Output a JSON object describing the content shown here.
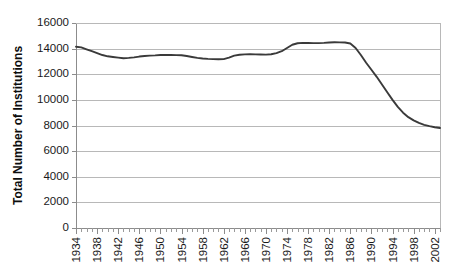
{
  "chart_data": {
    "type": "line",
    "title": "",
    "xlabel": "",
    "ylabel": "Total Number of Institutions",
    "ylim": [
      0,
      16000
    ],
    "xlim": [
      1934,
      2003
    ],
    "grid": true,
    "legend": false,
    "legend_position": "none",
    "line_color": "#3a3a3a",
    "ytick_labels": [
      "0",
      "2000",
      "4000",
      "6000",
      "8000",
      "10000",
      "12000",
      "14000",
      "16000"
    ],
    "ytick_values": [
      0,
      2000,
      4000,
      6000,
      8000,
      10000,
      12000,
      14000,
      16000
    ],
    "xtick_labels": [
      "1934",
      "1938",
      "1942",
      "1946",
      "1950",
      "1954",
      "1958",
      "1962",
      "1966",
      "1970",
      "1974",
      "1978",
      "1982",
      "1986",
      "1990",
      "1994",
      "1998",
      "2002"
    ],
    "xtick_values": [
      1934,
      1938,
      1942,
      1946,
      1950,
      1954,
      1958,
      1962,
      1966,
      1970,
      1974,
      1978,
      1982,
      1986,
      1990,
      1994,
      1998,
      2002
    ],
    "x": [
      1934,
      1935,
      1936,
      1937,
      1938,
      1939,
      1940,
      1941,
      1942,
      1943,
      1944,
      1945,
      1946,
      1947,
      1948,
      1949,
      1950,
      1951,
      1952,
      1953,
      1954,
      1955,
      1956,
      1957,
      1958,
      1959,
      1960,
      1961,
      1962,
      1963,
      1964,
      1965,
      1966,
      1967,
      1968,
      1969,
      1970,
      1971,
      1972,
      1973,
      1974,
      1975,
      1976,
      1977,
      1978,
      1979,
      1980,
      1981,
      1982,
      1983,
      1984,
      1985,
      1986,
      1987,
      1988,
      1989,
      1990,
      1991,
      1992,
      1993,
      1994,
      1995,
      1996,
      1997,
      1998,
      1999,
      2000,
      2001,
      2002,
      2003
    ],
    "values": [
      14150,
      14100,
      13950,
      13800,
      13650,
      13500,
      13400,
      13350,
      13300,
      13250,
      13280,
      13320,
      13380,
      13420,
      13450,
      13470,
      13500,
      13510,
      13500,
      13490,
      13480,
      13420,
      13350,
      13280,
      13230,
      13200,
      13180,
      13170,
      13180,
      13300,
      13450,
      13520,
      13550,
      13560,
      13550,
      13540,
      13530,
      13560,
      13650,
      13800,
      14050,
      14300,
      14420,
      14450,
      14440,
      14430,
      14430,
      14450,
      14480,
      14500,
      14490,
      14480,
      14400,
      14050,
      13500,
      12900,
      12350,
      11800,
      11200,
      10600,
      10000,
      9450,
      9000,
      8650,
      8400,
      8200,
      8050,
      7950,
      7860,
      7800
    ]
  },
  "geometry": {
    "plot_left": 76,
    "plot_right": 440,
    "plot_top": 23,
    "plot_bottom": 228
  }
}
